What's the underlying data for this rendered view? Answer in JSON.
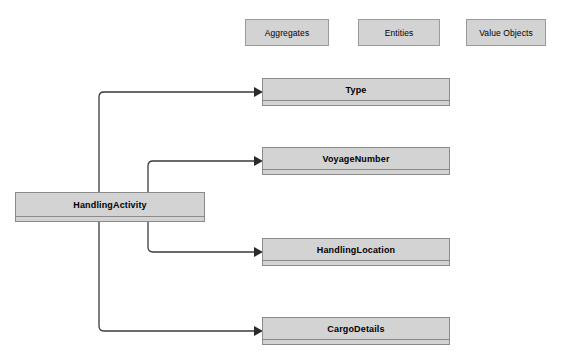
{
  "diagram": {
    "background_color": "#ffffff",
    "box_fill_color": "#d3d3d3",
    "box_border_color": "#8a8a8a",
    "connector_color": "#3a3a3a"
  },
  "legend": {
    "items": [
      {
        "label": "Aggregates"
      },
      {
        "label": "Entities"
      },
      {
        "label": "Value Objects"
      }
    ]
  },
  "classes": {
    "source": {
      "name": "HandlingActivity"
    },
    "targets": [
      {
        "name": "Type"
      },
      {
        "name": "VoyageNumber"
      },
      {
        "name": "HandlingLocation"
      },
      {
        "name": "CargoDetails"
      }
    ]
  },
  "connectors": [
    {
      "from": "HandlingActivity",
      "to": "Type",
      "arrow": "filled-triangle"
    },
    {
      "from": "HandlingActivity",
      "to": "VoyageNumber",
      "arrow": "filled-triangle"
    },
    {
      "from": "HandlingActivity",
      "to": "HandlingLocation",
      "arrow": "filled-triangle"
    },
    {
      "from": "HandlingActivity",
      "to": "CargoDetails",
      "arrow": "filled-triangle"
    }
  ]
}
